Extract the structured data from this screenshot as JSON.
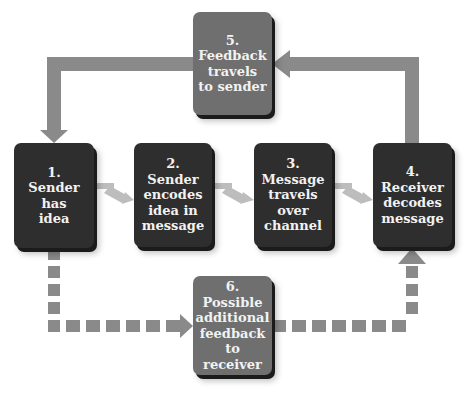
{
  "diagram": {
    "colors": {
      "box_dark": "#2e2e2e",
      "box_feedback": "#6f6f6f",
      "arrow": "#8a8a8a",
      "text": "#f2f2f2"
    },
    "steps": [
      {
        "number": "1.",
        "label": "Sender\nhas\nidea"
      },
      {
        "number": "2.",
        "label": "Sender\nencodes\nidea in\nmessage"
      },
      {
        "number": "3.",
        "label": "Message\ntravels\nover\nchannel"
      },
      {
        "number": "4.",
        "label": "Receiver\ndecodes\nmessage"
      },
      {
        "number": "5.",
        "label": "Feedback\ntravels\nto sender"
      },
      {
        "number": "6.",
        "label": "Possible\nadditional\nfeedback\nto receiver"
      }
    ],
    "connections": [
      {
        "from": "1",
        "to": "2",
        "style": "solid-small"
      },
      {
        "from": "2",
        "to": "3",
        "style": "solid-small"
      },
      {
        "from": "3",
        "to": "4",
        "style": "solid-small"
      },
      {
        "from": "4",
        "to": "5",
        "style": "solid-thick"
      },
      {
        "from": "5",
        "to": "1",
        "style": "solid-thick"
      },
      {
        "from": "1",
        "to": "6",
        "style": "dashed"
      },
      {
        "from": "6",
        "to": "4",
        "style": "dashed"
      }
    ]
  }
}
